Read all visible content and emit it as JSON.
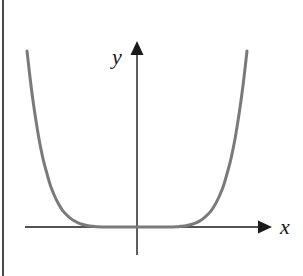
{
  "figure": {
    "background_color": "#ffffff",
    "width": 303,
    "height": 276,
    "scan_artifact_color": "#3a3a3a"
  },
  "axes": {
    "x_label": "x",
    "y_label": "y",
    "axis_color": "#1a1a1a",
    "axis_stroke_width": 1.4,
    "x_axis": {
      "y_pixel": 227,
      "x_start_pixel": 25,
      "x_end_pixel": 263,
      "arrow": "right"
    },
    "y_axis": {
      "x_pixel": 137,
      "y_start_pixel": 255,
      "y_end_pixel": 50,
      "arrow": "up"
    },
    "origin_pixel": {
      "x": 137,
      "y": 227
    }
  },
  "curve": {
    "color": "#7a7a7a",
    "stroke_width": 3.0,
    "left_endpoint_pixel": {
      "x": 29,
      "y": 51
    },
    "right_endpoint_pixel": {
      "x": 247,
      "y": 51
    },
    "vertex_pixel": {
      "x": 137,
      "y": 226
    }
  },
  "chart_data": {
    "type": "line",
    "title": "",
    "subtitle": "",
    "xlabel": "x",
    "ylabel": "y",
    "legend": [],
    "legend_position": "none",
    "grid": false,
    "xlim": [
      -1.25,
      1.25
    ],
    "ylim": [
      0,
      2.2
    ],
    "x_tick_labels": [],
    "y_tick_labels": [],
    "annotations": [],
    "series": [
      {
        "name": "y = x^6",
        "equation": "y = x^6",
        "x": [
          -1.12,
          -1.08,
          -1.04,
          -1.0,
          -0.96,
          -0.92,
          -0.88,
          -0.84,
          -0.8,
          -0.76,
          -0.72,
          -0.68,
          -0.64,
          -0.6,
          -0.56,
          -0.52,
          -0.48,
          -0.44,
          -0.4,
          -0.32,
          -0.24,
          -0.16,
          -0.08,
          0.0,
          0.08,
          0.16,
          0.24,
          0.32,
          0.4,
          0.44,
          0.48,
          0.52,
          0.56,
          0.6,
          0.64,
          0.68,
          0.72,
          0.76,
          0.8,
          0.84,
          0.88,
          0.92,
          0.96,
          1.0,
          1.04,
          1.08,
          1.12
        ],
        "values": [
          1.97,
          1.59,
          1.27,
          1.0,
          0.78,
          0.61,
          0.46,
          0.35,
          0.26,
          0.19,
          0.14,
          0.1,
          0.069,
          0.047,
          0.031,
          0.02,
          0.012,
          0.0073,
          0.0041,
          0.0011,
          0.00019,
          1.7e-05,
          3e-07,
          0.0,
          3e-07,
          1.7e-05,
          0.00019,
          0.0011,
          0.0041,
          0.0073,
          0.012,
          0.02,
          0.031,
          0.047,
          0.069,
          0.1,
          0.14,
          0.19,
          0.26,
          0.35,
          0.46,
          0.61,
          0.78,
          1.0,
          1.27,
          1.59,
          1.97
        ]
      }
    ]
  }
}
